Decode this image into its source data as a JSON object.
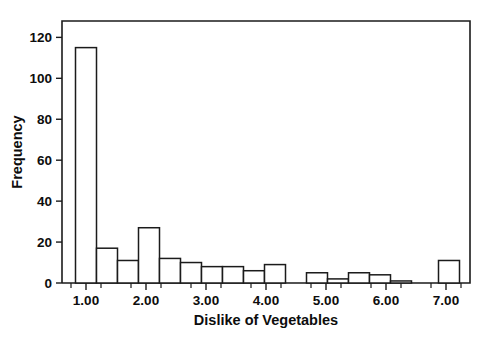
{
  "chart_data": {
    "type": "bar",
    "title": "",
    "xlabel": "Dislike of Vegetables",
    "ylabel": "Frequency",
    "xlim": [
      0.6,
      7.4
    ],
    "ylim": [
      0,
      128
    ],
    "grid": false,
    "legend": "none",
    "bin_width": 0.35,
    "x_ticks": [
      "1.00",
      "2.00",
      "3.00",
      "4.00",
      "5.00",
      "6.00",
      "7.00"
    ],
    "x_tick_values": [
      1,
      2,
      3,
      4,
      5,
      6,
      7
    ],
    "x_minor_tick_values": [
      0.75,
      1.25,
      1.75,
      2.25,
      2.75,
      3.25,
      3.75,
      4.25,
      4.75,
      5.25,
      5.75,
      6.25,
      6.75,
      7.25
    ],
    "y_ticks": [
      "0",
      "20",
      "40",
      "60",
      "80",
      "100",
      "120"
    ],
    "y_tick_values": [
      0,
      20,
      40,
      60,
      80,
      100,
      120
    ],
    "bins": [
      {
        "center": 1.0,
        "value": 115
      },
      {
        "center": 1.35,
        "value": 17
      },
      {
        "center": 1.7,
        "value": 11
      },
      {
        "center": 2.05,
        "value": 27
      },
      {
        "center": 2.4,
        "value": 12
      },
      {
        "center": 2.75,
        "value": 10
      },
      {
        "center": 3.1,
        "value": 8
      },
      {
        "center": 3.45,
        "value": 8
      },
      {
        "center": 3.8,
        "value": 6
      },
      {
        "center": 4.15,
        "value": 9
      },
      {
        "center": 4.85,
        "value": 5
      },
      {
        "center": 5.2,
        "value": 2
      },
      {
        "center": 5.55,
        "value": 5
      },
      {
        "center": 5.9,
        "value": 4
      },
      {
        "center": 6.25,
        "value": 1
      },
      {
        "center": 7.05,
        "value": 11
      }
    ],
    "categories": [
      1.0,
      1.35,
      1.7,
      2.05,
      2.4,
      2.75,
      3.1,
      3.45,
      3.8,
      4.15,
      4.85,
      5.2,
      5.55,
      5.9,
      6.25,
      7.05
    ],
    "values": [
      115,
      17,
      11,
      27,
      12,
      10,
      8,
      8,
      6,
      9,
      5,
      2,
      5,
      4,
      1,
      11
    ],
    "colors": {
      "bar_fill": "#ffffff",
      "bar_stroke": "#1b1b1b",
      "axis": "#1b1b1b",
      "text": "#0d0d0d",
      "background": "#ffffff"
    }
  }
}
